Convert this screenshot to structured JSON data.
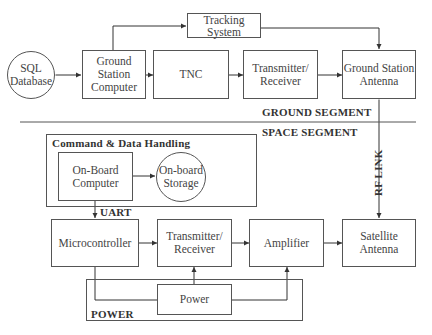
{
  "ground_segment": {
    "label": "GROUND SEGMENT",
    "sql_database": "SQL\nDatabase",
    "ground_station_computer": "Ground\nStation\nComputer",
    "tnc": "TNC",
    "transmitter_receiver": "Transmitter/\nReceiver",
    "ground_station_antenna": "Ground Station\nAntenna",
    "tracking_system": "Tracking\nSystem"
  },
  "space_segment": {
    "label": "SPACE SEGMENT",
    "cdh_label": "Command & Data Handling",
    "on_board_computer": "On-Board\nComputer",
    "on_board_storage": "On-board\nStorage",
    "uart_label": "UART",
    "microcontroller": "Microcontroller",
    "transmitter_receiver": "Transmitter/\nReceiver",
    "amplifier": "Amplifier",
    "satellite_antenna": "Satellite\nAntenna",
    "power": "Power",
    "power_label": "POWER"
  },
  "rf_link_label": "RF LINK",
  "colors": {
    "line": "#555555",
    "text": "#333333",
    "background": "#ffffff"
  }
}
